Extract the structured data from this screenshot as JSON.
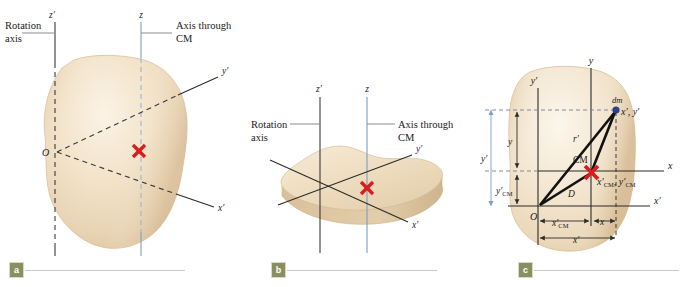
{
  "figure": {
    "colors": {
      "body_fill": "#eedcc0",
      "body_fill_light": "#f7ecd9",
      "rotation_axis": "#3a3a3a",
      "cm_axis": "#7e9dc4",
      "cm_marker": "#d81f1f",
      "dm_dot": "#2e3f8f",
      "caption_badge": "#8a8f5f",
      "background": "#ffffff"
    }
  },
  "panels": [
    {
      "id": "a",
      "caption_letter": "a",
      "callouts": {
        "rotation_axis_line1": "Rotation",
        "rotation_axis_line2": "axis",
        "cm_axis_line1": "Axis through",
        "cm_axis_line2": "CM"
      },
      "axes": [
        {
          "name": "z-prime-axis",
          "label": "z′"
        },
        {
          "name": "z-axis",
          "label": "z"
        },
        {
          "name": "y-prime-axis",
          "label": "y′"
        },
        {
          "name": "x-prime-axis",
          "label": "x′"
        }
      ],
      "origin_label": "O",
      "cm_marker_label": "×"
    },
    {
      "id": "b",
      "caption_letter": "b",
      "callouts": {
        "rotation_axis_line1": "Rotation",
        "rotation_axis_line2": "axis",
        "cm_axis_line1": "Axis through",
        "cm_axis_line2": "CM"
      },
      "axes": [
        {
          "name": "z-prime-axis",
          "label": "z′"
        },
        {
          "name": "z-axis",
          "label": "z"
        },
        {
          "name": "y-prime-axis",
          "label": "y′"
        },
        {
          "name": "x-prime-axis",
          "label": "x′"
        }
      ],
      "cm_marker_label": "×"
    },
    {
      "id": "c",
      "caption_letter": "c",
      "axes": [
        {
          "name": "y-prime-axis",
          "label": "y′"
        },
        {
          "name": "y-axis",
          "label": "y"
        },
        {
          "name": "x-axis",
          "label": "x"
        },
        {
          "name": "x-prime-axis",
          "label": "x′"
        }
      ],
      "origin_label": "O",
      "cm_label": "CM",
      "mass_element_label": "dm",
      "mass_element_coords": "x′, y′",
      "cm_coords_base": "x′",
      "cm_coords_sub": "CM",
      "cm_coords_base2": "y′",
      "cm_coords_sub2": "CM",
      "vector_r_label": "r′",
      "vector_D_label": "D",
      "dimensions": {
        "y_outer": "y′",
        "y_inner": "y",
        "y_cm_base": "y′",
        "y_cm_sub": "CM",
        "x_cm_base": "x′",
        "x_cm_sub": "CM",
        "x_inner": "x",
        "x_outer": "x′"
      }
    }
  ]
}
